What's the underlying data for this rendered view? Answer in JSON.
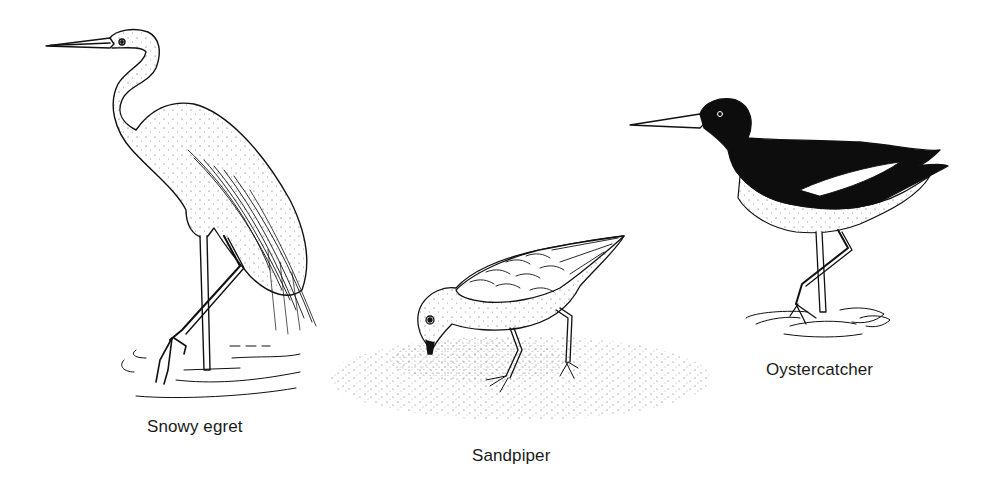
{
  "illustration": {
    "style": "black-and-white pen-and-ink stipple drawing",
    "colors": {
      "ink": "#111111",
      "paper": "#ffffff",
      "text": "#1a1a1a"
    },
    "birds": [
      {
        "id": "snowy-egret",
        "label": "Snowy egret",
        "setting": "wading in water"
      },
      {
        "id": "sandpiper",
        "label": "Sandpiper",
        "setting": "probing stippled sand"
      },
      {
        "id": "oystercatcher",
        "label": "Oystercatcher",
        "setting": "standing in water"
      }
    ]
  }
}
